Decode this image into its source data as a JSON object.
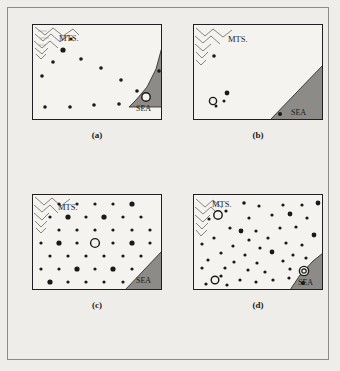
{
  "figure": {
    "background_color": "#efedea",
    "frame_color": "#8d8b88",
    "map_border_color": "#231f20",
    "map_fill_color": "#f5f3f0",
    "sea_fill_color": "#8d8b88",
    "dot_color": "#1b1918"
  },
  "labels": {
    "mts": "MTS.",
    "sea": "SEA"
  },
  "panels": [
    {
      "id": "a",
      "caption": "(a)",
      "mts_label": "MTS.",
      "sea_label": "SEA",
      "coast": "M 129 24 L 129 22 L 123 44 L 114 62 L 103 75 L 96 82 L 129 82 Z",
      "dots": [
        {
          "x": 38,
          "y": 14,
          "r": 1.6
        },
        {
          "x": 30,
          "y": 25,
          "r": 2.6
        },
        {
          "x": 48,
          "y": 34,
          "r": 1.8
        },
        {
          "x": 20,
          "y": 37,
          "r": 1.8
        },
        {
          "x": 68,
          "y": 43,
          "r": 1.8
        },
        {
          "x": 9,
          "y": 51,
          "r": 1.8
        },
        {
          "x": 88,
          "y": 55,
          "r": 1.8
        },
        {
          "x": 126,
          "y": 46,
          "r": 1.8
        },
        {
          "x": 104,
          "y": 66,
          "r": 1.8
        },
        {
          "x": 12,
          "y": 82,
          "r": 1.8
        },
        {
          "x": 37,
          "y": 82,
          "r": 1.8
        },
        {
          "x": 61,
          "y": 80,
          "r": 1.8
        },
        {
          "x": 86,
          "y": 79,
          "r": 1.8
        }
      ],
      "rings": [
        {
          "x": 113,
          "y": 72,
          "r": 4.2,
          "type": "single"
        }
      ]
    },
    {
      "id": "b",
      "caption": "(b)",
      "mts_label": "MTS.",
      "sea_label": "SEA",
      "coast": "M 129 40 L 129 95 L 76 95 Z",
      "dots": [
        {
          "x": 20,
          "y": 31,
          "r": 1.8
        },
        {
          "x": 33,
          "y": 68,
          "r": 2.4
        },
        {
          "x": 30,
          "y": 76,
          "r": 1.5
        },
        {
          "x": 22,
          "y": 81,
          "r": 1.5
        },
        {
          "x": 86,
          "y": 89,
          "r": 2.0
        }
      ],
      "rings": [
        {
          "x": 19,
          "y": 76,
          "r": 3.6,
          "type": "single"
        }
      ]
    },
    {
      "id": "c",
      "caption": "(c)",
      "mts_label": "MTS.",
      "sea_label": "SEA",
      "coast": "M 129 56 L 129 95 L 92 95 Z",
      "dots": [
        {
          "x": 26,
          "y": 9,
          "r": 1.6
        },
        {
          "x": 44,
          "y": 9,
          "r": 1.6
        },
        {
          "x": 62,
          "y": 9,
          "r": 1.6
        },
        {
          "x": 80,
          "y": 9,
          "r": 1.6
        },
        {
          "x": 99,
          "y": 9,
          "r": 2.6
        },
        {
          "x": 17,
          "y": 22,
          "r": 1.6
        },
        {
          "x": 35,
          "y": 22,
          "r": 2.6
        },
        {
          "x": 53,
          "y": 22,
          "r": 1.6
        },
        {
          "x": 71,
          "y": 22,
          "r": 2.6
        },
        {
          "x": 90,
          "y": 22,
          "r": 1.6
        },
        {
          "x": 108,
          "y": 22,
          "r": 1.6
        },
        {
          "x": 26,
          "y": 35,
          "r": 1.6
        },
        {
          "x": 44,
          "y": 35,
          "r": 1.6
        },
        {
          "x": 62,
          "y": 35,
          "r": 1.6
        },
        {
          "x": 80,
          "y": 35,
          "r": 1.6
        },
        {
          "x": 99,
          "y": 35,
          "r": 1.6
        },
        {
          "x": 117,
          "y": 35,
          "r": 1.6
        },
        {
          "x": 8,
          "y": 48,
          "r": 1.6
        },
        {
          "x": 26,
          "y": 48,
          "r": 2.6
        },
        {
          "x": 44,
          "y": 48,
          "r": 1.6
        },
        {
          "x": 80,
          "y": 48,
          "r": 1.6
        },
        {
          "x": 99,
          "y": 48,
          "r": 2.6
        },
        {
          "x": 117,
          "y": 48,
          "r": 1.6
        },
        {
          "x": 17,
          "y": 61,
          "r": 1.6
        },
        {
          "x": 35,
          "y": 61,
          "r": 1.6
        },
        {
          "x": 53,
          "y": 61,
          "r": 1.6
        },
        {
          "x": 71,
          "y": 61,
          "r": 1.6
        },
        {
          "x": 90,
          "y": 61,
          "r": 1.6
        },
        {
          "x": 108,
          "y": 61,
          "r": 1.6
        },
        {
          "x": 8,
          "y": 74,
          "r": 1.6
        },
        {
          "x": 26,
          "y": 74,
          "r": 1.6
        },
        {
          "x": 44,
          "y": 74,
          "r": 2.6
        },
        {
          "x": 62,
          "y": 74,
          "r": 1.6
        },
        {
          "x": 80,
          "y": 74,
          "r": 2.6
        },
        {
          "x": 99,
          "y": 74,
          "r": 1.6
        },
        {
          "x": 17,
          "y": 87,
          "r": 2.6
        },
        {
          "x": 35,
          "y": 87,
          "r": 1.6
        },
        {
          "x": 53,
          "y": 87,
          "r": 1.6
        },
        {
          "x": 71,
          "y": 87,
          "r": 1.6
        },
        {
          "x": 90,
          "y": 87,
          "r": 1.6
        }
      ],
      "rings": [
        {
          "x": 62,
          "y": 48,
          "r": 4.4,
          "type": "single"
        }
      ]
    },
    {
      "id": "d",
      "caption": "(d)",
      "mts_label": "MTS.",
      "sea_label": "SEA",
      "coast": "M 129 58 L 129 95 L 96 95 L 106 80 L 119 66 Z",
      "dots": [
        {
          "x": 50,
          "y": 8,
          "r": 1.8
        },
        {
          "x": 65,
          "y": 11,
          "r": 1.6
        },
        {
          "x": 89,
          "y": 10,
          "r": 1.6
        },
        {
          "x": 108,
          "y": 10,
          "r": 1.6
        },
        {
          "x": 124,
          "y": 8,
          "r": 2.4
        },
        {
          "x": 32,
          "y": 16,
          "r": 1.6
        },
        {
          "x": 55,
          "y": 23,
          "r": 1.6
        },
        {
          "x": 78,
          "y": 20,
          "r": 1.6
        },
        {
          "x": 96,
          "y": 19,
          "r": 2.4
        },
        {
          "x": 113,
          "y": 23,
          "r": 1.6
        },
        {
          "x": 15,
          "y": 24,
          "r": 1.6
        },
        {
          "x": 36,
          "y": 33,
          "r": 1.6
        },
        {
          "x": 62,
          "y": 36,
          "r": 1.6
        },
        {
          "x": 47,
          "y": 36,
          "r": 2.4
        },
        {
          "x": 86,
          "y": 33,
          "r": 1.6
        },
        {
          "x": 102,
          "y": 32,
          "r": 1.6
        },
        {
          "x": 20,
          "y": 43,
          "r": 1.6
        },
        {
          "x": 55,
          "y": 45,
          "r": 1.6
        },
        {
          "x": 74,
          "y": 43,
          "r": 1.6
        },
        {
          "x": 120,
          "y": 40,
          "r": 2.4
        },
        {
          "x": 8,
          "y": 49,
          "r": 1.6
        },
        {
          "x": 39,
          "y": 51,
          "r": 1.6
        },
        {
          "x": 66,
          "y": 53,
          "r": 1.6
        },
        {
          "x": 92,
          "y": 48,
          "r": 1.6
        },
        {
          "x": 108,
          "y": 50,
          "r": 1.6
        },
        {
          "x": 27,
          "y": 58,
          "r": 1.6
        },
        {
          "x": 51,
          "y": 60,
          "r": 1.6
        },
        {
          "x": 78,
          "y": 57,
          "r": 2.4
        },
        {
          "x": 99,
          "y": 60,
          "r": 1.6
        },
        {
          "x": 14,
          "y": 65,
          "r": 1.6
        },
        {
          "x": 40,
          "y": 67,
          "r": 1.6
        },
        {
          "x": 63,
          "y": 68,
          "r": 1.6
        },
        {
          "x": 89,
          "y": 66,
          "r": 1.6
        },
        {
          "x": 112,
          "y": 63,
          "r": 1.6
        },
        {
          "x": 8,
          "y": 73,
          "r": 1.6
        },
        {
          "x": 31,
          "y": 73,
          "r": 1.6
        },
        {
          "x": 54,
          "y": 75,
          "r": 1.6
        },
        {
          "x": 71,
          "y": 77,
          "r": 1.6
        },
        {
          "x": 96,
          "y": 74,
          "r": 1.6
        },
        {
          "x": 27,
          "y": 81,
          "r": 1.6
        },
        {
          "x": 46,
          "y": 85,
          "r": 1.6
        },
        {
          "x": 62,
          "y": 87,
          "r": 1.6
        },
        {
          "x": 79,
          "y": 85,
          "r": 1.6
        },
        {
          "x": 95,
          "y": 83,
          "r": 1.6
        },
        {
          "x": 12,
          "y": 89,
          "r": 1.6
        },
        {
          "x": 33,
          "y": 90,
          "r": 1.6
        },
        {
          "x": 109,
          "y": 88,
          "r": 2.0
        }
      ],
      "rings": [
        {
          "x": 24,
          "y": 20,
          "r": 4.2,
          "type": "single"
        },
        {
          "x": 21,
          "y": 85,
          "r": 3.8,
          "type": "single"
        },
        {
          "x": 110,
          "y": 76,
          "r": 4.6,
          "type": "double"
        }
      ]
    }
  ]
}
